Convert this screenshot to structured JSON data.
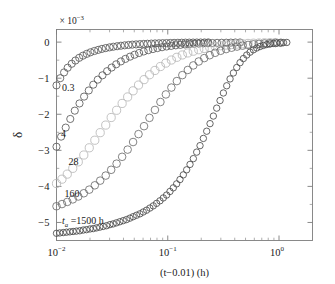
{
  "chart_data": {
    "type": "scatter",
    "title": "",
    "xlabel": "(t−0.01) (h)",
    "ylabel": "δ",
    "y_exponent_label": "× 10",
    "y_exponent_sup": "−3",
    "xscale": "log",
    "yscale": "linear",
    "xlim": [
      0.01,
      2.0
    ],
    "ylim": [
      -5.5,
      0.35
    ],
    "grid": false,
    "legend_position": "inline-annotations",
    "xticks": [
      {
        "value": 0.01,
        "mantissa": "10",
        "exponent": "−2"
      },
      {
        "value": 0.1,
        "mantissa": "10",
        "exponent": "−1"
      },
      {
        "value": 1.0,
        "mantissa": "10",
        "exponent": "0"
      }
    ],
    "yticks": [
      {
        "value": 0,
        "label": "0"
      },
      {
        "value": -1,
        "label": "−1"
      },
      {
        "value": -2,
        "label": "−2"
      },
      {
        "value": -3,
        "label": "−3"
      },
      {
        "value": -4,
        "label": "−4"
      },
      {
        "value": -5,
        "label": "−5"
      }
    ],
    "marker": "open-circle",
    "series": [
      {
        "name": "0.3",
        "annotation": "0.3",
        "annotation_x": 0.0112,
        "annotation_y": -1.35,
        "color": "#5a5a5a",
        "marker_size": 3.6,
        "x": [
          0.01,
          0.0108,
          0.0117,
          0.0126,
          0.0137,
          0.0148,
          0.016,
          0.0173,
          0.0187,
          0.0202,
          0.0219,
          0.0237,
          0.0256,
          0.0277,
          0.03,
          0.0324,
          0.0351,
          0.0379,
          0.041,
          0.0444,
          0.048,
          0.0519,
          0.0562,
          0.0608,
          0.0657,
          0.0711,
          0.0769,
          0.0832,
          0.09,
          0.0974,
          0.1053,
          0.114,
          0.1233,
          0.1334,
          0.1443,
          0.1561,
          0.1689,
          0.1827,
          0.1976,
          0.2138,
          0.2312
        ],
        "y": [
          -1.2,
          -1.0,
          -0.84,
          -0.71,
          -0.6,
          -0.51,
          -0.435,
          -0.375,
          -0.325,
          -0.282,
          -0.246,
          -0.215,
          -0.188,
          -0.165,
          -0.145,
          -0.128,
          -0.113,
          -0.1,
          -0.089,
          -0.079,
          -0.07,
          -0.063,
          -0.056,
          -0.05,
          -0.045,
          -0.04,
          -0.036,
          -0.032,
          -0.029,
          -0.026,
          -0.023,
          -0.021,
          -0.019,
          -0.017,
          -0.015,
          -0.014,
          -0.012,
          -0.011,
          -0.01,
          -0.009,
          -0.008
        ]
      },
      {
        "name": "4",
        "annotation": "4",
        "annotation_x": 0.011,
        "annotation_y": -2.62,
        "color": "#5a5a5a",
        "marker_size": 3.6,
        "x": [
          0.01,
          0.011,
          0.0121,
          0.0133,
          0.0146,
          0.0161,
          0.0177,
          0.0195,
          0.0214,
          0.0235,
          0.0259,
          0.0285,
          0.0313,
          0.0344,
          0.0379,
          0.0416,
          0.0458,
          0.0503,
          0.0553,
          0.0608,
          0.0669,
          0.0735,
          0.0808,
          0.0889,
          0.0977,
          0.1074,
          0.1181,
          0.1299,
          0.1428,
          0.157,
          0.1727,
          0.1898,
          0.2088,
          0.2295,
          0.2524,
          0.2775,
          0.3051,
          0.3355,
          0.3689,
          0.4056,
          0.446
        ],
        "y": [
          -2.9,
          -2.62,
          -2.37,
          -2.13,
          -1.9,
          -1.7,
          -1.51,
          -1.34,
          -1.18,
          -1.04,
          -0.92,
          -0.805,
          -0.705,
          -0.615,
          -0.535,
          -0.465,
          -0.403,
          -0.349,
          -0.301,
          -0.259,
          -0.223,
          -0.192,
          -0.165,
          -0.141,
          -0.121,
          -0.104,
          -0.089,
          -0.076,
          -0.065,
          -0.055,
          -0.047,
          -0.04,
          -0.034,
          -0.029,
          -0.025,
          -0.021,
          -0.018,
          -0.016,
          -0.013,
          -0.011,
          -0.01
        ]
      },
      {
        "name": "28",
        "annotation": "28",
        "annotation_x": 0.0128,
        "annotation_y": -3.4,
        "color": "#b8b8b8",
        "marker_size": 4.1,
        "x": [
          0.01,
          0.0112,
          0.0125,
          0.014,
          0.0157,
          0.0176,
          0.0197,
          0.0221,
          0.0247,
          0.0277,
          0.031,
          0.0347,
          0.0389,
          0.0436,
          0.0488,
          0.0546,
          0.0612,
          0.0685,
          0.0767,
          0.0859,
          0.0962,
          0.1078,
          0.1207,
          0.1352,
          0.1514,
          0.1696,
          0.1899,
          0.2127,
          0.2382,
          0.2668,
          0.2988,
          0.3346,
          0.3748,
          0.4198,
          0.4702,
          0.5266,
          0.5898,
          0.6606,
          0.7399,
          0.8287,
          0.9281
        ],
        "y": [
          -3.92,
          -3.8,
          -3.66,
          -3.5,
          -3.32,
          -3.13,
          -2.93,
          -2.72,
          -2.51,
          -2.3,
          -2.09,
          -1.89,
          -1.7,
          -1.52,
          -1.35,
          -1.19,
          -1.04,
          -0.905,
          -0.785,
          -0.677,
          -0.581,
          -0.496,
          -0.421,
          -0.356,
          -0.3,
          -0.252,
          -0.211,
          -0.176,
          -0.146,
          -0.121,
          -0.1,
          -0.082,
          -0.067,
          -0.055,
          -0.045,
          -0.036,
          -0.029,
          -0.024,
          -0.019,
          -0.015,
          -0.012
        ]
      },
      {
        "name": "160",
        "annotation": "160",
        "annotation_x": 0.0118,
        "annotation_y": -4.29,
        "color": "#6e6e6e",
        "marker_size": 3.8,
        "x": [
          0.01,
          0.0112,
          0.0125,
          0.014,
          0.0157,
          0.0176,
          0.0197,
          0.0221,
          0.0247,
          0.0277,
          0.031,
          0.0347,
          0.0389,
          0.0436,
          0.0488,
          0.0546,
          0.0612,
          0.0685,
          0.0767,
          0.0859,
          0.0962,
          0.1078,
          0.1207,
          0.1352,
          0.1514,
          0.1696,
          0.1899,
          0.2127,
          0.2382,
          0.2668,
          0.2988,
          0.3346,
          0.3748,
          0.4198,
          0.4702,
          0.5266,
          0.5898,
          0.6606,
          0.7399,
          0.8287,
          0.9281,
          1.0394
        ],
        "y": [
          -4.55,
          -4.49,
          -4.43,
          -4.36,
          -4.28,
          -4.19,
          -4.09,
          -3.97,
          -3.84,
          -3.7,
          -3.54,
          -3.37,
          -3.18,
          -2.98,
          -2.77,
          -2.55,
          -2.33,
          -2.1,
          -1.88,
          -1.66,
          -1.45,
          -1.26,
          -1.08,
          -0.915,
          -0.772,
          -0.646,
          -0.537,
          -0.443,
          -0.363,
          -0.296,
          -0.24,
          -0.193,
          -0.155,
          -0.124,
          -0.098,
          -0.078,
          -0.061,
          -0.048,
          -0.037,
          -0.029,
          -0.022,
          -0.017
        ]
      },
      {
        "name": "ta=1500h",
        "annotation": "=1500 h",
        "annotation_italic": "t",
        "annotation_sub": "a",
        "annotation_x": 0.0112,
        "annotation_y": -5.05,
        "color": "#4a4a4a",
        "marker_size": 3.2,
        "x": [
          0.01,
          0.0107,
          0.0115,
          0.0123,
          0.0132,
          0.0141,
          0.0151,
          0.0162,
          0.0174,
          0.0186,
          0.02,
          0.0214,
          0.0229,
          0.0245,
          0.0263,
          0.0282,
          0.0302,
          0.0323,
          0.0346,
          0.0371,
          0.0398,
          0.0426,
          0.0457,
          0.0489,
          0.0524,
          0.0562,
          0.0602,
          0.0645,
          0.0691,
          0.0741,
          0.0794,
          0.0851,
          0.0912,
          0.0977,
          0.1047,
          0.1122,
          0.1202,
          0.1288,
          0.138,
          0.1479,
          0.1585,
          0.1698,
          0.182,
          0.195,
          0.2089,
          0.2239,
          0.2399,
          0.257,
          0.2754,
          0.2951,
          0.3162,
          0.3388,
          0.3631,
          0.389,
          0.4169,
          0.4467,
          0.4786,
          0.5129,
          0.5495,
          0.5888,
          0.631,
          0.6761,
          0.7244,
          0.7762,
          0.8318,
          0.8913,
          0.955,
          1.0233,
          1.0965,
          1.1749
        ],
        "y": [
          -5.3,
          -5.29,
          -5.28,
          -5.27,
          -5.26,
          -5.25,
          -5.24,
          -5.23,
          -5.21,
          -5.2,
          -5.18,
          -5.17,
          -5.15,
          -5.13,
          -5.11,
          -5.09,
          -5.06,
          -5.04,
          -5.01,
          -4.98,
          -4.95,
          -4.92,
          -4.88,
          -4.84,
          -4.8,
          -4.76,
          -4.71,
          -4.66,
          -4.6,
          -4.54,
          -4.47,
          -4.4,
          -4.32,
          -4.24,
          -4.14,
          -4.04,
          -3.93,
          -3.81,
          -3.68,
          -3.54,
          -3.39,
          -3.23,
          -3.05,
          -2.87,
          -2.67,
          -2.47,
          -2.26,
          -2.05,
          -1.83,
          -1.62,
          -1.41,
          -1.21,
          -1.02,
          -0.855,
          -0.703,
          -0.57,
          -0.455,
          -0.358,
          -0.278,
          -0.213,
          -0.162,
          -0.122,
          -0.091,
          -0.067,
          -0.049,
          -0.036,
          -0.026,
          -0.019,
          -0.013,
          -0.009
        ]
      }
    ]
  },
  "figure": {
    "background": "#ffffff",
    "axis_color": "#7d7d7d"
  }
}
